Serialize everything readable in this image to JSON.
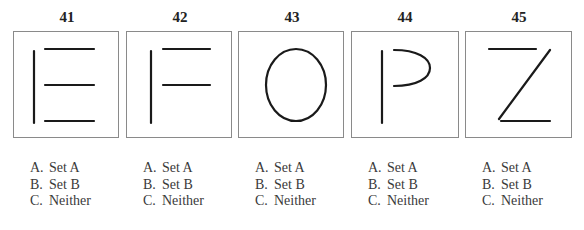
{
  "items": [
    {
      "number": "41",
      "figure": "letter-E-lines",
      "options": [
        {
          "letter": "A.",
          "text": "Set A"
        },
        {
          "letter": "B.",
          "text": "Set B"
        },
        {
          "letter": "C.",
          "text": "Neither"
        }
      ]
    },
    {
      "number": "42",
      "figure": "letter-F-lines",
      "options": [
        {
          "letter": "A.",
          "text": "Set A"
        },
        {
          "letter": "B.",
          "text": "Set B"
        },
        {
          "letter": "C.",
          "text": "Neither"
        }
      ]
    },
    {
      "number": "43",
      "figure": "letter-O-oval",
      "options": [
        {
          "letter": "A.",
          "text": "Set A"
        },
        {
          "letter": "B.",
          "text": "Set B"
        },
        {
          "letter": "C.",
          "text": "Neither"
        }
      ]
    },
    {
      "number": "44",
      "figure": "letter-P-line-curve",
      "options": [
        {
          "letter": "A.",
          "text": "Set A"
        },
        {
          "letter": "B.",
          "text": "Set B"
        },
        {
          "letter": "C.",
          "text": "Neither"
        }
      ]
    },
    {
      "number": "45",
      "figure": "letter-Z-lines",
      "options": [
        {
          "letter": "A.",
          "text": "Set A"
        },
        {
          "letter": "B.",
          "text": "Set B"
        },
        {
          "letter": "C.",
          "text": "Neither"
        }
      ]
    }
  ]
}
